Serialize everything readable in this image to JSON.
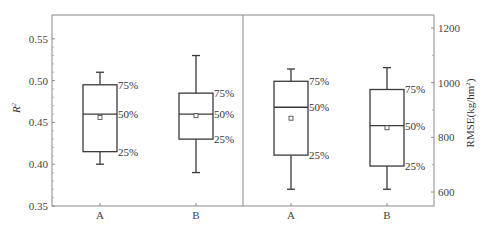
{
  "chart_data": [
    {
      "type": "box",
      "panel": "left",
      "title": "",
      "xlabel": "",
      "ylabel": "R²",
      "ylabel_base": "R",
      "ylabel_sup": "2",
      "ylim": [
        0.35,
        0.58
      ],
      "yticks": [
        0.35,
        0.4,
        0.45,
        0.5,
        0.55
      ],
      "ytick_labels": [
        "0.35",
        "0.40",
        "0.45",
        "0.50",
        "0.55"
      ],
      "categories": [
        "A",
        "B"
      ],
      "boxes": [
        {
          "label": "A",
          "whisker_low": 0.4,
          "q1": 0.415,
          "median": 0.46,
          "q3": 0.495,
          "whisker_high": 0.51,
          "mean": 0.456
        },
        {
          "label": "B",
          "whisker_low": 0.39,
          "q1": 0.43,
          "median": 0.46,
          "q3": 0.485,
          "whisker_high": 0.53,
          "mean": 0.458
        }
      ],
      "annotations": [
        "75%",
        "50%",
        "25%"
      ]
    },
    {
      "type": "box",
      "panel": "right",
      "title": "",
      "xlabel": "",
      "ylabel": "RMSE(kg/hm²)",
      "ylabel_base": "RMSE(kg/hm",
      "ylabel_sup": "2",
      "ylabel_end": ")",
      "ylim": [
        550,
        1250
      ],
      "yticks": [
        600,
        800,
        1000,
        1200
      ],
      "ytick_labels": [
        "600",
        "800",
        "1000",
        "1200"
      ],
      "categories": [
        "A",
        "B"
      ],
      "boxes": [
        {
          "label": "A",
          "whisker_low": 610,
          "q1": 735,
          "median": 910,
          "q3": 1005,
          "whisker_high": 1050,
          "mean": 870
        },
        {
          "label": "B",
          "whisker_low": 610,
          "q1": 695,
          "median": 843,
          "q3": 975,
          "whisker_high": 1055,
          "mean": 835
        }
      ],
      "annotations": [
        "75%",
        "50%",
        "25%"
      ]
    }
  ],
  "colors": {
    "frame": "#8a8a8a",
    "box": "#3a3a3a",
    "text": "#444444"
  }
}
